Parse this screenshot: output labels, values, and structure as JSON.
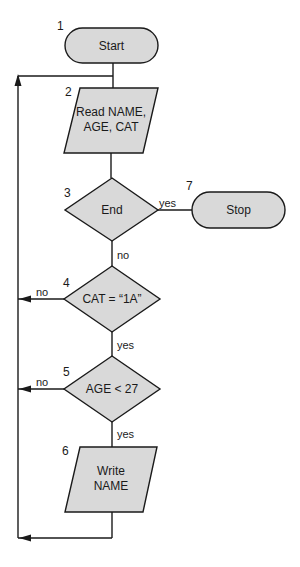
{
  "diagram": {
    "type": "flowchart",
    "colors": {
      "fill": "#d9d9d9",
      "stroke": "#1a1a1a",
      "background": "#ffffff"
    },
    "nodes": [
      {
        "id": 1,
        "number": "1",
        "shape": "terminal",
        "label": "Start"
      },
      {
        "id": 2,
        "number": "2",
        "shape": "parallelogram",
        "label_line1": "Read NAME,",
        "label_line2": "AGE, CAT"
      },
      {
        "id": 3,
        "number": "3",
        "shape": "diamond",
        "label": "End"
      },
      {
        "id": 4,
        "number": "4",
        "shape": "diamond",
        "label": "CAT = “1A”"
      },
      {
        "id": 5,
        "number": "5",
        "shape": "diamond",
        "label": "AGE < 27"
      },
      {
        "id": 6,
        "number": "6",
        "shape": "parallelogram",
        "label_line1": "Write",
        "label_line2": "NAME"
      },
      {
        "id": 7,
        "number": "7",
        "shape": "terminal",
        "label": "Stop"
      }
    ],
    "edges": [
      {
        "from": 1,
        "to": 2,
        "label": ""
      },
      {
        "from": 2,
        "to": 3,
        "label": ""
      },
      {
        "from": 3,
        "to": 7,
        "label": "yes"
      },
      {
        "from": 3,
        "to": 4,
        "label": "no"
      },
      {
        "from": 4,
        "to": 2,
        "label": "no"
      },
      {
        "from": 4,
        "to": 5,
        "label": "yes"
      },
      {
        "from": 5,
        "to": 2,
        "label": "no"
      },
      {
        "from": 5,
        "to": 6,
        "label": "yes"
      },
      {
        "from": 6,
        "to": 2,
        "label": ""
      }
    ]
  }
}
